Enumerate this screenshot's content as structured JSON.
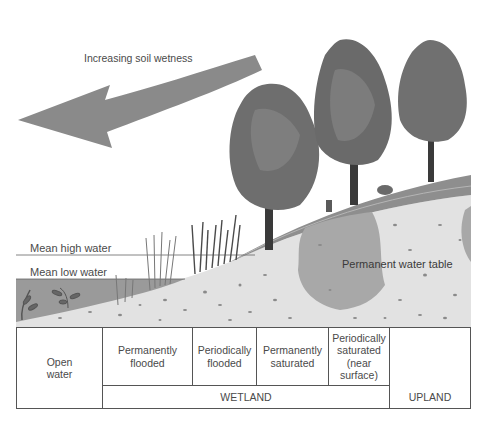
{
  "diagram": {
    "arrow_label": "Increasing soil wetness",
    "water_levels": {
      "high": "Mean high water",
      "low": "Mean low water"
    },
    "water_table_label": "Permanent water table",
    "zones": [
      {
        "label": "Open\nwater"
      },
      {
        "label": "Permanently\nflooded"
      },
      {
        "label": "Periodically\nflooded"
      },
      {
        "label": "Permanently\nsaturated"
      },
      {
        "label": "Periodically\nsaturated\n(near\nsurface)"
      },
      {
        "label": ""
      }
    ],
    "groups": {
      "wetland": "WETLAND",
      "upland": "UPLAND"
    },
    "colors": {
      "arrow": "#8a8a8a",
      "water": "#9a9a9a",
      "soil": "#e4e4e4",
      "soil_wet": "#a8a8a8",
      "hill_top": "#8e8e8e",
      "tree_foliage": "#6e6e6e",
      "tree_trunk": "#3a3a3a"
    }
  }
}
